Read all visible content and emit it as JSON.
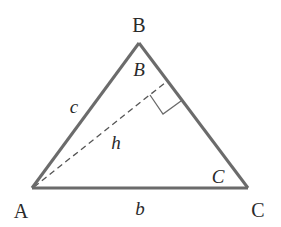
{
  "diagram": {
    "type": "triangle-with-altitude",
    "vertices": {
      "A": "A",
      "B": "B",
      "C": "C"
    },
    "angles": {
      "B": "B",
      "C": "C"
    },
    "sides": {
      "c": "c",
      "b": "b"
    },
    "altitude": {
      "label": "h",
      "from": "A",
      "to_side": "BC",
      "right_angle_marker": true
    },
    "colors": {
      "stroke": "#6b6b6b",
      "text": "#2a2a2a",
      "background": "#ffffff"
    }
  }
}
